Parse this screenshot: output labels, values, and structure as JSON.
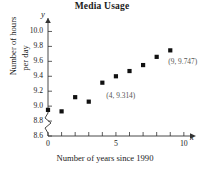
{
  "chart_data": {
    "type": "scatter",
    "title": "Media Usage",
    "xlabel": "Number of years since 1990",
    "ylabel_line1": "Number of hours",
    "ylabel_line2": "per day",
    "x_axis_var": "x",
    "y_axis_var": "y",
    "xlim": [
      0,
      10.6
    ],
    "ylim": [
      8.6,
      10.1
    ],
    "y_axis_break": true,
    "grid": false,
    "legend": null,
    "xticks": [
      0,
      1,
      2,
      3,
      4,
      5,
      6,
      7,
      8,
      9,
      10
    ],
    "xtick_labels": [
      {
        "value": 0,
        "text": "0"
      },
      {
        "value": 5,
        "text": "5"
      },
      {
        "value": 10,
        "text": "10"
      }
    ],
    "yticks": [
      8.6,
      8.8,
      9.0,
      9.2,
      9.4,
      9.6,
      9.8,
      10.0
    ],
    "ytick_labels": [
      "8.6",
      "8.8",
      "9.0",
      "9.2",
      "9.4",
      "9.6",
      "9.8",
      "10.0"
    ],
    "x": [
      0,
      1,
      2,
      3,
      4,
      5,
      6,
      7,
      8,
      9
    ],
    "values": [
      8.95,
      8.93,
      9.12,
      9.06,
      9.314,
      9.4,
      9.47,
      9.55,
      9.66,
      9.747
    ],
    "marker": "square",
    "marker_color": "#111111",
    "annotations": [
      {
        "text": "(4, 9.314)",
        "x": 4,
        "y": 9.314
      },
      {
        "text": "(9, 9.747)",
        "x": 9,
        "y": 9.747
      }
    ]
  },
  "colors": {
    "axis": "#333333",
    "marker": "#111111",
    "annotation": "#555555",
    "background": "#ffffff"
  }
}
